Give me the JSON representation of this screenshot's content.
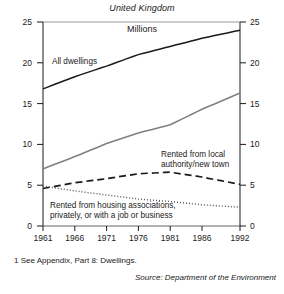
{
  "figure": {
    "title": "United Kingdom",
    "unit_label": "Millions",
    "footnote": "1  See Appendix, Part 8: Dwellings.",
    "source": "Source: Department of the Environment"
  },
  "axis": {
    "y_ticks": [
      "0",
      "5",
      "10",
      "15",
      "20",
      "25"
    ],
    "x_ticks": [
      "1961",
      "1966",
      "1971",
      "1976",
      "1981",
      "1986",
      "1992"
    ]
  },
  "labels": {
    "all_dwellings": "All dwellings",
    "local_authority_line1": "Rented from local",
    "local_authority_line2": "authority/new town",
    "housing_assoc_line1": "Rented from housing associations,",
    "housing_assoc_line2": "privately, or with a job or business"
  },
  "colors": {
    "all_dwellings": "#1a1a1a",
    "owner_occupied": "#808080",
    "local_authority": "#1a1a1a",
    "other_rented": "#555555",
    "axis": "#1a1a1a",
    "gridline": "#999999",
    "background": "#ffffff"
  },
  "chart_data": {
    "type": "line",
    "title": "United Kingdom",
    "subtitle": "Millions",
    "xlabel": "",
    "ylabel": "Millions",
    "xlim": [
      1961,
      1992
    ],
    "ylim": [
      0,
      25
    ],
    "grid": false,
    "legend": "in-plot annotations",
    "x": [
      1961,
      1966,
      1971,
      1976,
      1981,
      1986,
      1992
    ],
    "series": [
      {
        "name": "All dwellings",
        "style": "solid-black",
        "color": "#1a1a1a",
        "values": [
          16.8,
          18.3,
          19.6,
          21.0,
          22.0,
          23.0,
          24.0
        ]
      },
      {
        "name": "Owner occupied",
        "style": "solid-grey",
        "color": "#808080",
        "values": [
          7.0,
          8.5,
          10.1,
          11.4,
          12.4,
          14.3,
          16.3
        ]
      },
      {
        "name": "Rented from local authority/new town",
        "style": "dashed",
        "color": "#1a1a1a",
        "values": [
          4.6,
          5.3,
          5.8,
          6.4,
          6.6,
          6.0,
          5.1
        ]
      },
      {
        "name": "Rented from housing associations, privately, or with a job or business",
        "style": "dotted",
        "color": "#555555",
        "values": [
          4.9,
          4.3,
          3.8,
          3.3,
          3.0,
          2.6,
          2.3
        ]
      }
    ]
  }
}
